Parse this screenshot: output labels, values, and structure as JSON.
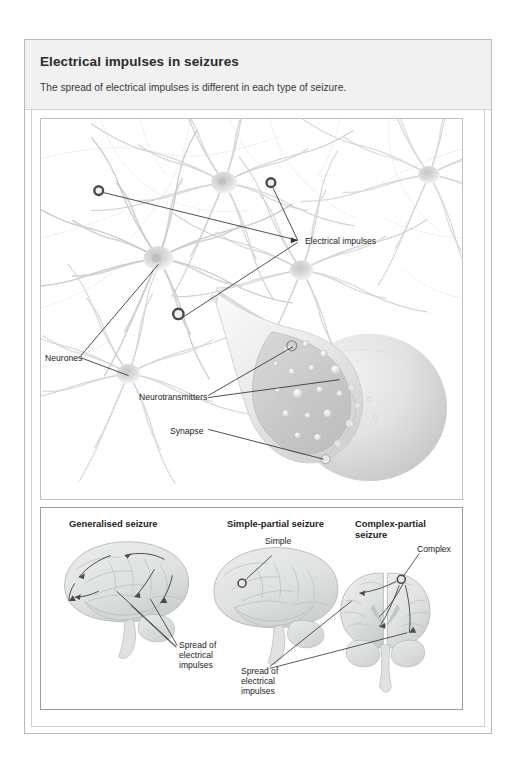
{
  "header": {
    "title": "Electrical impulses in seizures",
    "subtitle": "The spread of electrical impulses is different in each type of seizure."
  },
  "top_illustration": {
    "name": "neuron-synapse-diagram",
    "labels": {
      "electrical_impulses": "Electrical impulses",
      "neurones": "Neurones",
      "neurotransmitters": "Neurotransmitters",
      "synapse": "Synapse"
    }
  },
  "bottom_illustration": {
    "name": "seizure-types-brain-diagram",
    "panels": [
      {
        "heading": "Generalised seizure",
        "labels": [
          "Spread of\nelectrical\nimpulses"
        ]
      },
      {
        "heading": "Simple-partial seizure",
        "labels": [
          "Simple"
        ]
      },
      {
        "heading": "Complex-partial\nseizure",
        "labels": [
          "Complex",
          "Spread of\nelectrical\nimpulses"
        ]
      }
    ]
  },
  "colors": {
    "header_band": "#f1f1f1",
    "card_border": "#b9b9b9",
    "frame_border": "#c2c2c2",
    "text": "#1c1c1c",
    "neuron_gray": "#d9d9d9",
    "brain_gray": "#d2d4d2",
    "leader_line": "#3a3a3a"
  }
}
